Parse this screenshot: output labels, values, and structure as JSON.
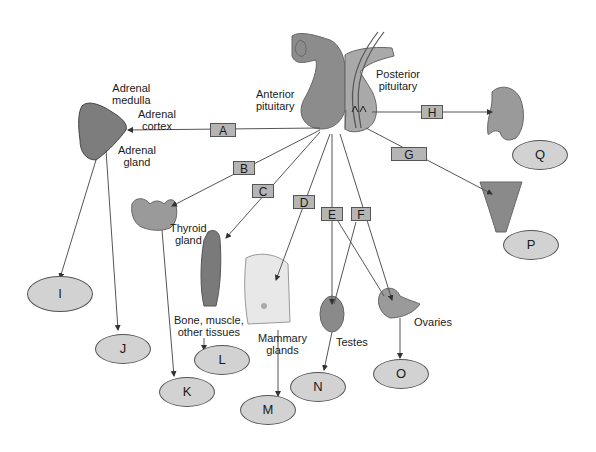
{
  "diagram": {
    "colors": {
      "line": "#555555",
      "box_fill": "#b5b5b5",
      "oval_fill": "#d2d2d2",
      "tissue_gray": "#8a8a8a"
    },
    "structures": {
      "anterior_pituitary": "Anterior\npituitary",
      "posterior_pituitary": "Posterior\npituitary",
      "adrenal_medulla": "Adrenal\nmedulla",
      "adrenal_cortex": "Adrenal\ncortex",
      "adrenal_gland": "Adrenal\ngland",
      "thyroid_gland": "Thyroid\ngland",
      "bone_muscle": "Bone, muscle,\nother tissues",
      "mammary_glands": "Mammary\nglands",
      "testes": "Testes",
      "ovaries": "Ovaries"
    },
    "hormone_boxes": [
      "A",
      "B",
      "C",
      "D",
      "E",
      "F",
      "G",
      "H"
    ],
    "answer_ovals": [
      "I",
      "J",
      "K",
      "L",
      "M",
      "N",
      "O",
      "P",
      "Q"
    ]
  }
}
